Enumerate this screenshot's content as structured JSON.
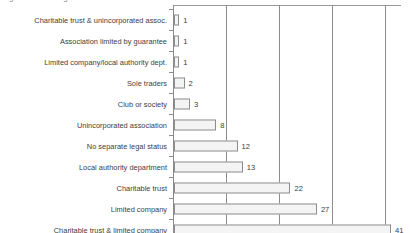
{
  "title_remnant": "Legal status of organisation",
  "chart_data": {
    "type": "bar",
    "orientation": "horizontal",
    "title": "",
    "xlabel": "",
    "ylabel": "",
    "xlim": [
      0,
      41
    ],
    "grid": true,
    "gridlines": [
      10,
      20,
      30,
      40
    ],
    "legend": "none",
    "categories": [
      "Charitable trust & unincorporated assoc.",
      "Association limited by guarantee",
      "Limited company/local authority dept.",
      "Sole traders",
      "Club or society",
      "Unincorporated association",
      "No separate legal status",
      "Local authority department",
      "Charitable trust",
      "Limited company",
      "Charitable trust & limited company"
    ],
    "values": [
      1,
      1,
      1,
      2,
      3,
      8,
      12,
      13,
      22,
      27,
      41
    ],
    "value_labels": [
      "1",
      "1",
      "1",
      "2",
      "3",
      "8",
      "12",
      "13",
      "22",
      "27",
      "41"
    ],
    "colors": {
      "bar_fill": "#f4f4f4",
      "bar_border": "#8d8d8d",
      "gridline": "#8c8c8c",
      "axis": "#8a8a8a",
      "text": "#3d3d3d"
    }
  }
}
